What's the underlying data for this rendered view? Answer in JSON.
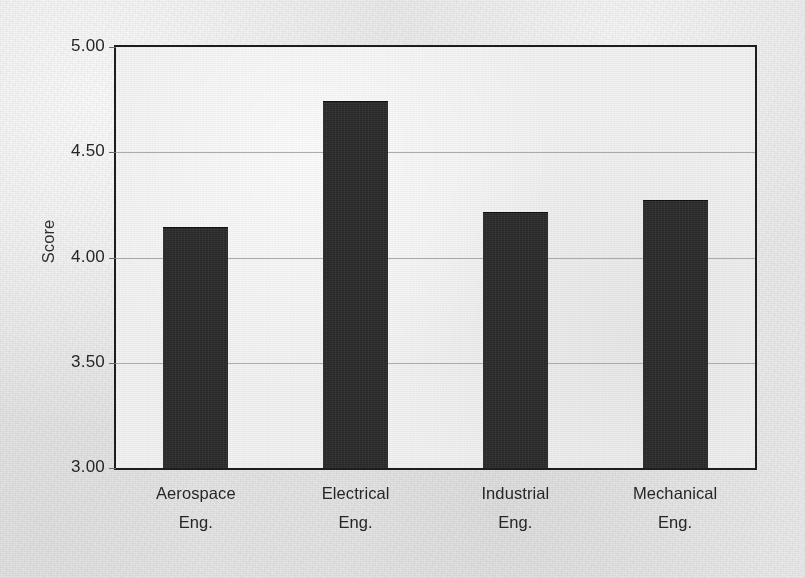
{
  "chart_data": {
    "type": "bar",
    "title": "",
    "subtitle": "",
    "xlabel": "",
    "ylabel": "Score",
    "ylim": [
      3.0,
      5.0
    ],
    "ytick_step": 0.5,
    "ytick_labels": [
      "5.00",
      "4.50",
      "4.00",
      "3.50",
      "3.00"
    ],
    "ytick_values": [
      5.0,
      4.5,
      4.0,
      3.5,
      3.0
    ],
    "grid": true,
    "grid_axis": "y",
    "legend": false,
    "legend_position": "none",
    "categories": [
      "Aerospace Eng.",
      "Electrical Eng.",
      "Industrial Eng.",
      "Mechanical Eng."
    ],
    "category_lines": [
      [
        "Aerospace",
        "Eng."
      ],
      [
        "Electrical",
        "Eng."
      ],
      [
        "Industrial",
        "Eng."
      ],
      [
        "Mechanical",
        "Eng."
      ]
    ],
    "values": [
      4.14,
      4.74,
      4.21,
      4.27
    ],
    "bar_color": "#2b2b2b",
    "frame_color": "#1d1d1d",
    "gridline_color": "#9e9e9e",
    "plot_background": "#f1f1f1",
    "page_background": "#e9e9e9",
    "text_color": "#262626"
  },
  "axis": {
    "y_title": "Score"
  },
  "ticks": [
    {
      "label": "5.00",
      "value": 5.0
    },
    {
      "label": "4.50",
      "value": 4.5
    },
    {
      "label": "4.00",
      "value": 4.0
    },
    {
      "label": "3.50",
      "value": 3.5
    },
    {
      "label": "3.00",
      "value": 3.0
    }
  ],
  "bars": [
    {
      "line1": "Aerospace",
      "line2": "Eng.",
      "value": 4.14
    },
    {
      "line1": "Electrical",
      "line2": "Eng.",
      "value": 4.74
    },
    {
      "line1": "Industrial",
      "line2": "Eng.",
      "value": 4.21
    },
    {
      "line1": "Mechanical",
      "line2": "Eng.",
      "value": 4.27
    }
  ]
}
